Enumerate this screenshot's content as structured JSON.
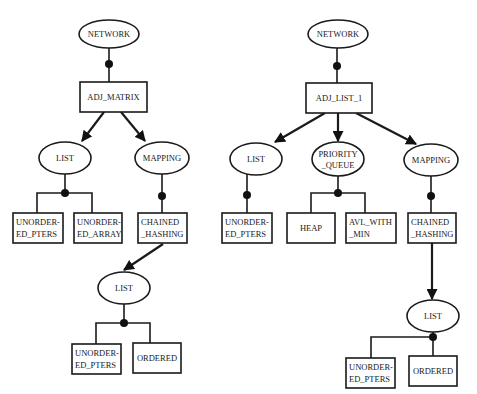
{
  "diagram": {
    "type": "tree",
    "colors": {
      "line": "#1a1a1a",
      "background": "#ffffff",
      "junction_dot": "#111111"
    },
    "left_tree": {
      "root": "NETWORK",
      "implementation": "ADJ_MATRIX",
      "components": [
        "LIST",
        "MAPPING"
      ],
      "list_variants": [
        "UNORDER-",
        "ED_PTERS",
        "UNORDER-",
        "ED_ARRAY"
      ],
      "mapping_variant": [
        "CHAINED",
        "_HASHING"
      ],
      "sub_list": "LIST",
      "sub_list_variants": [
        "UNORDER-",
        "ED_PTERS",
        "ORDERED"
      ]
    },
    "right_tree": {
      "root": "NETWORK",
      "implementation": "ADJ_LIST_1",
      "components": [
        "LIST",
        "PRIORITY",
        "_QUEUE",
        "MAPPING"
      ],
      "list_variant": [
        "UNORDER-",
        "ED_PTERS"
      ],
      "pq_variants": [
        "HEAP",
        "AVL_WITH",
        "_MIN"
      ],
      "mapping_variant": [
        "CHAINED",
        "_HASHING"
      ],
      "sub_list": "LIST",
      "sub_list_variants": [
        "UNORDER-",
        "ED_PTERS",
        "ORDERED"
      ]
    }
  }
}
